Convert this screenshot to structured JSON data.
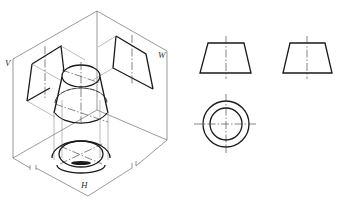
{
  "figure": {
    "line_color": "#1a1a1a",
    "frame_color": "#555555",
    "background": "#ffffff"
  },
  "isometric_view": {
    "plane_labels": {
      "front": "V",
      "side": "W",
      "horizontal": "H"
    }
  },
  "orthographic_views": {
    "front_view": {
      "shape": "trapezoid",
      "name": "Front view"
    },
    "side_view": {
      "shape": "trapezoid",
      "name": "Left side view"
    },
    "top_view": {
      "shape": "concentric-circles",
      "name": "Top view"
    }
  }
}
